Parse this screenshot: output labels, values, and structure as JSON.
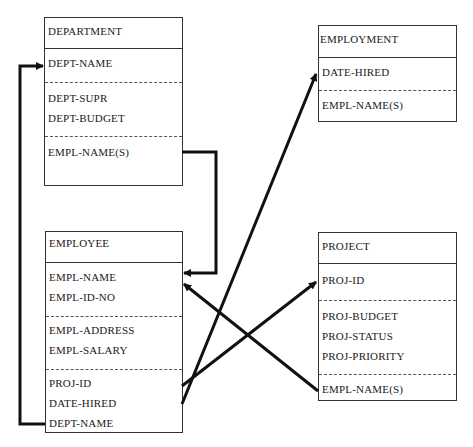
{
  "diagram": {
    "type": "entity-relationship",
    "entities": {
      "department": {
        "title": "DEPARTMENT",
        "key_fields": [
          "DEPT-NAME"
        ],
        "attributes": [
          "DEPT-SUPR",
          "DEPT-BUDGET"
        ],
        "relation_fields": [
          "EMPL-NAME(S)"
        ]
      },
      "employment": {
        "title": "EMPLOYMENT",
        "key_fields": [
          "DATE-HIRED"
        ],
        "relation_fields": [
          "EMPL-NAME(S)"
        ]
      },
      "employee": {
        "title": "EMPLOYEE",
        "key_fields": [
          "EMPL-NAME",
          "EMPL-ID-NO"
        ],
        "attributes": [
          "EMPL-ADDRESS",
          "EMPL-SALARY"
        ],
        "relation_fields": [
          "PROJ-ID",
          "DATE-HIRED",
          "DEPT-NAME"
        ]
      },
      "project": {
        "title": "PROJECT",
        "key_fields": [
          "PROJ-ID"
        ],
        "attributes": [
          "PROJ-BUDGET",
          "PROJ-STATUS",
          "PROJ-PRIORITY"
        ],
        "relation_fields": [
          "EMPL-NAME(S)"
        ]
      }
    },
    "relationships": [
      {
        "from": "DEPARTMENT.EMPL-NAME(S)",
        "to": "EMPLOYEE.EMPL-NAME"
      },
      {
        "from": "EMPLOYEE.DEPT-NAME",
        "to": "DEPARTMENT.DEPT-NAME"
      },
      {
        "from": "EMPLOYEE.DATE-HIRED",
        "to": "EMPLOYMENT.DATE-HIRED"
      },
      {
        "from": "EMPLOYEE.PROJ-ID",
        "to": "PROJECT.PROJ-ID"
      },
      {
        "from": "PROJECT.EMPL-NAME(S)",
        "to": "EMPLOYEE.EMPL-NAME"
      }
    ],
    "colors": {
      "line": "#111111",
      "box_border": "#333333",
      "background": "#ffffff"
    }
  }
}
